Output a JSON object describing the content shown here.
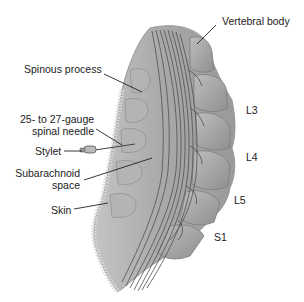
{
  "figure": {
    "labels": {
      "vertebral_body": "Vertebral body",
      "spinous_process": "Spinous process",
      "needle_line1": "25- to 27-gauge",
      "needle_line2": "spinal needle",
      "stylet": "Stylet",
      "subarachnoid_line1": "Subarachnoid",
      "subarachnoid_line2": "space",
      "skin": "Skin"
    },
    "vertebra_levels": [
      "L3",
      "L4",
      "L5",
      "S1"
    ],
    "colors": {
      "tissue": "#a9a9a9",
      "tissue_light": "#c8c8c8",
      "tissue_dark": "#7a7a7a",
      "nerve_lines": "#555555",
      "leader_lines": "#222222",
      "text": "#222222"
    }
  }
}
